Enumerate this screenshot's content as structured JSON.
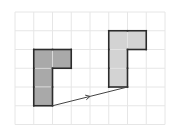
{
  "diagram": {
    "grid": {
      "cols": 8,
      "rows": 6,
      "line_color": "#e6e6e6"
    },
    "shapes": [
      {
        "name": "original-shape",
        "fill": "#a9a9a9",
        "stroke": "#2b2b2b",
        "cells": [
          [
            1,
            2
          ],
          [
            2,
            2
          ],
          [
            1,
            3
          ],
          [
            1,
            4
          ]
        ]
      },
      {
        "name": "translated-shape",
        "fill": "#d3d3d3",
        "stroke": "#2b2b2b",
        "cells": [
          [
            5,
            1
          ],
          [
            6,
            1
          ],
          [
            5,
            2
          ],
          [
            5,
            3
          ]
        ]
      }
    ],
    "translation_vector": {
      "from": [
        2,
        5
      ],
      "to": [
        6,
        4
      ],
      "color": "#444444",
      "dx": 4,
      "dy": -1
    }
  }
}
